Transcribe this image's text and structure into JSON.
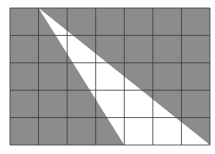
{
  "diagram": {
    "type": "grid-shaded-triangle",
    "grid": {
      "columns": 7,
      "rows": 5,
      "x0": 10,
      "y0": 8,
      "x1": 210,
      "y1": 145
    },
    "colors": {
      "shade": "#8c8c8c",
      "white": "#ffffff",
      "line": "#3a3a3a",
      "background": "#ffffff"
    },
    "triangle_vertices_grid": [
      [
        1,
        0
      ],
      [
        4,
        5
      ],
      [
        7,
        5
      ]
    ]
  }
}
